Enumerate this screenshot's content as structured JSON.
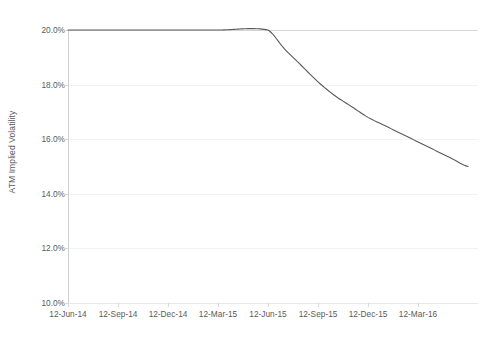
{
  "chart_data": {
    "type": "line",
    "title": "",
    "xlabel": "",
    "ylabel": "ATM Implied Volatility",
    "ylim": [
      10.0,
      20.0
    ],
    "ytick_labels": [
      "20.0%",
      "18.0%",
      "16.0%",
      "14.0%",
      "12.0%",
      "10.0%"
    ],
    "ytick_values": [
      20.0,
      18.0,
      16.0,
      14.0,
      12.0,
      10.0
    ],
    "xtick_labels": [
      "12-Jun-14",
      "12-Sep-14",
      "12-Dec-14",
      "12-Mar-15",
      "12-Jun-15",
      "12-Sep-15",
      "12-Dec-15",
      "12-Mar-16"
    ],
    "grid": "horizontal",
    "legend": "none",
    "series": [
      {
        "name": "ATM Implied Volatility",
        "color": "#5a5a5a",
        "x": [
          "12-Jun-14",
          "12-Sep-14",
          "12-Dec-14",
          "12-Mar-15",
          "12-Jun-15",
          "12-Jul-15",
          "12-Aug-15",
          "12-Sep-15",
          "12-Oct-15",
          "12-Nov-15",
          "12-Dec-15",
          "12-Jan-16",
          "12-Feb-16",
          "12-Mar-16",
          "12-Apr-16",
          "12-May-16",
          "12-Jun-16"
        ],
        "values": [
          20.0,
          20.0,
          20.0,
          20.0,
          20.0,
          19.3,
          18.7,
          18.1,
          17.6,
          17.2,
          16.8,
          16.5,
          16.2,
          15.9,
          15.6,
          15.3,
          15.0
        ]
      }
    ],
    "annotations": [
      {
        "text": "flat at 20.0% through 12-Jun-15, then convex decay to 15.0%",
        "visible": false
      }
    ]
  },
  "axes": {
    "y_title": "ATM Implied Volatility",
    "y_ticks": [
      {
        "label": "20.0%",
        "value": 20.0,
        "py": 30
      },
      {
        "label": "18.0%",
        "value": 18.0,
        "py": 85
      },
      {
        "label": "16.0%",
        "value": 16.0,
        "py": 139
      },
      {
        "label": "14.0%",
        "value": 14.0,
        "py": 194
      },
      {
        "label": "12.0%",
        "value": 12.0,
        "py": 248
      },
      {
        "label": "10.0%",
        "value": 10.0,
        "py": 303
      }
    ],
    "x_ticks": [
      {
        "label": "12-Jun-14",
        "px": 68
      },
      {
        "label": "12-Sep-14",
        "px": 118
      },
      {
        "label": "12-Dec-14",
        "px": 168
      },
      {
        "label": "12-Mar-15",
        "px": 218
      },
      {
        "label": "12-Jun-15",
        "px": 268
      },
      {
        "label": "12-Sep-15",
        "px": 318
      },
      {
        "label": "12-Dec-15",
        "px": 368
      },
      {
        "label": "12-Mar-16",
        "px": 418
      }
    ]
  },
  "colors": {
    "series_line": "#5a5a5a",
    "gridline": "#f2f2f2",
    "axis": "#d6d6d6",
    "tick_text": "#5a5a5a",
    "plot_background": "#ffffff"
  }
}
